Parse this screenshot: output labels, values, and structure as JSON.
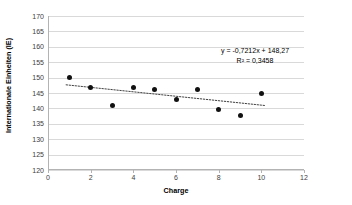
{
  "chart_data": {
    "type": "scatter",
    "title": "",
    "xlabel": "Charge",
    "ylabel": "Internationale Einheiten (IE)",
    "xlim": [
      0,
      12
    ],
    "ylim": [
      120,
      170
    ],
    "xticks": [
      0,
      2,
      4,
      6,
      8,
      10,
      12
    ],
    "yticks": [
      120,
      125,
      130,
      135,
      140,
      145,
      150,
      155,
      160,
      165,
      170
    ],
    "grid": "horizontal",
    "legend": "none",
    "x": [
      1,
      2,
      3,
      4,
      5,
      6,
      7,
      8,
      9,
      10
    ],
    "values": [
      150.0,
      146.8,
      140.8,
      146.9,
      146.0,
      143.0,
      146.0,
      139.8,
      137.7,
      144.8
    ],
    "series": [
      {
        "name": "Internationale Einheiten (IE)",
        "marker": "circle",
        "color": "#111111",
        "values": [
          150.0,
          146.8,
          140.8,
          146.9,
          146.0,
          143.0,
          146.0,
          139.8,
          137.7,
          144.8
        ]
      }
    ],
    "trendline": {
      "type": "linear",
      "slope": -0.7212,
      "intercept": 148.27,
      "r_squared": 0.3458,
      "x_start": 0.85,
      "x_end": 10.2,
      "style": "dotted",
      "color": "#404040"
    },
    "annotations": {
      "equation": "y = -0,7212x + 148,27",
      "r_squared": "R² = 0,3458"
    }
  },
  "axes": {
    "x": {
      "title": "Charge",
      "tick_labels": [
        "0",
        "2",
        "4",
        "6",
        "8",
        "10",
        "12"
      ]
    },
    "y": {
      "title": "Internationale Einheiten (IE)",
      "tick_labels": [
        "170",
        "165",
        "160",
        "155",
        "150",
        "145",
        "140",
        "135",
        "130",
        "125",
        "120"
      ]
    }
  },
  "annotation": {
    "equation_line": "y = -0,7212x + 148,27",
    "r2_line": "R² = 0,3458"
  },
  "colors": {
    "marker": "#111111",
    "trendline": "#404040",
    "gridline": "#d9d9d9",
    "axis": "#b3b3b3",
    "background": "#ffffff"
  }
}
